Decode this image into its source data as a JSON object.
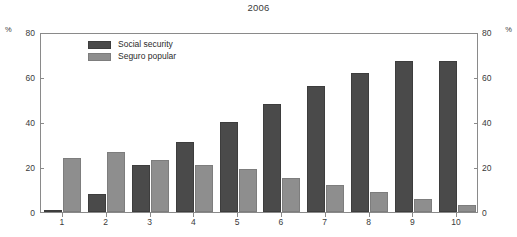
{
  "chart_data": {
    "type": "bar",
    "title": "2006",
    "xlabel": "",
    "ylabel": "%",
    "ylabel_right": "%",
    "ylim": [
      0,
      80
    ],
    "yticks": [
      0,
      20,
      40,
      60,
      80
    ],
    "grid": false,
    "legend_position": "top-left-inside",
    "categories": [
      "1",
      "2",
      "3",
      "4",
      "5",
      "6",
      "7",
      "8",
      "9",
      "10"
    ],
    "series": [
      {
        "name": "Social security",
        "color": "#4a4a4a",
        "values": [
          1,
          8,
          21,
          31,
          40,
          48,
          56,
          62,
          67,
          67
        ]
      },
      {
        "name": "Seguro popular",
        "color": "#8e8e8e",
        "values": [
          24,
          26.5,
          23,
          21,
          19,
          15,
          12,
          9,
          6,
          3
        ]
      }
    ]
  },
  "colors": {
    "social_security": "#4a4a4a",
    "seguro_popular": "#8e8e8e",
    "axis": "#8a8a8a",
    "text": "#2b2b2b",
    "background": "#ffffff"
  }
}
